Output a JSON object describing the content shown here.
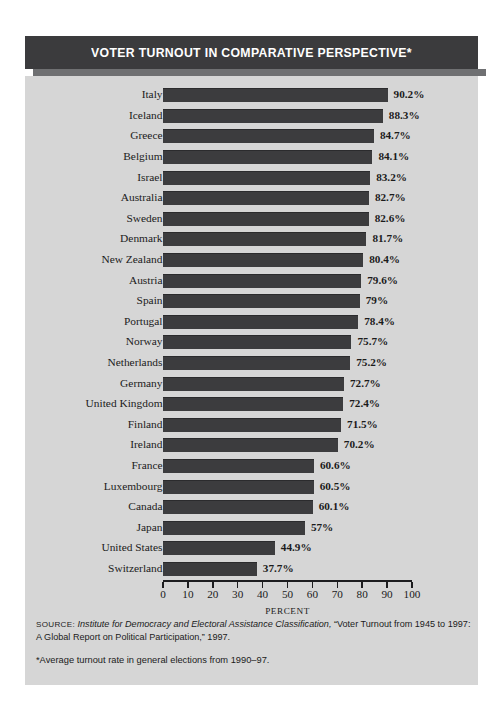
{
  "title": "VOTER TURNOUT IN COMPARATIVE PERSPECTIVE*",
  "notes": {
    "source_label": "SOURCE:",
    "source_italic": "Institute for Democracy and Electoral Assistance Classification,",
    "source_rest": "“Voter Turnout from 1945 to 1997: A Global Report on Political Participation,” 1997.",
    "footnote": "*Average turnout rate in general elections from 1990–97."
  },
  "colors": {
    "banner": "#3b3b3d",
    "panel": "#d6d6d6",
    "bar": "#3c3c3e",
    "axis": "#1d1d1f",
    "text": "#1b1b1b",
    "title_text": "#ffffff"
  },
  "chart_data": {
    "type": "bar",
    "orientation": "horizontal",
    "title": "VOTER TURNOUT IN COMPARATIVE PERSPECTIVE*",
    "xlabel": "PERCENT",
    "ylabel": "",
    "xlim": [
      0,
      100
    ],
    "xticks": [
      0,
      10,
      20,
      30,
      40,
      50,
      60,
      70,
      80,
      90,
      100
    ],
    "grid": false,
    "legend": null,
    "categories": [
      "Italy",
      "Iceland",
      "Greece",
      "Belgium",
      "Israel",
      "Australia",
      "Sweden",
      "Denmark",
      "New Zealand",
      "Austria",
      "Spain",
      "Portugal",
      "Norway",
      "Netherlands",
      "Germany",
      "United Kingdom",
      "Finland",
      "Ireland",
      "France",
      "Luxembourg",
      "Canada",
      "Japan",
      "United States",
      "Switzerland"
    ],
    "values": [
      90.2,
      88.3,
      84.7,
      84.1,
      83.2,
      82.7,
      82.6,
      81.7,
      80.4,
      79.6,
      79.0,
      78.4,
      75.7,
      75.2,
      72.7,
      72.4,
      71.5,
      70.2,
      60.6,
      60.5,
      60.1,
      57.0,
      44.9,
      37.7
    ],
    "value_labels": [
      "90.2%",
      "88.3%",
      "84.7%",
      "84.1%",
      "83.2%",
      "82.7%",
      "82.6%",
      "81.7%",
      "80.4%",
      "79.6%",
      "79%",
      "78.4%",
      "75.7%",
      "75.2%",
      "72.7%",
      "72.4%",
      "71.5%",
      "70.2%",
      "60.6%",
      "60.5%",
      "60.1%",
      "57%",
      "44.9%",
      "37.7%"
    ]
  }
}
